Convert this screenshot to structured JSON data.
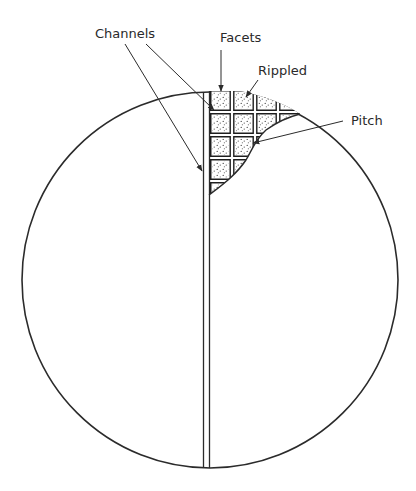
{
  "labels": {
    "channels": "Channels",
    "facets": "Facets",
    "rippled": "Rippled",
    "pitch": "Pitch"
  },
  "colors": {
    "ink": "#2b2b2b",
    "background": "#ffffff",
    "stipple": "#3a3a3a"
  }
}
